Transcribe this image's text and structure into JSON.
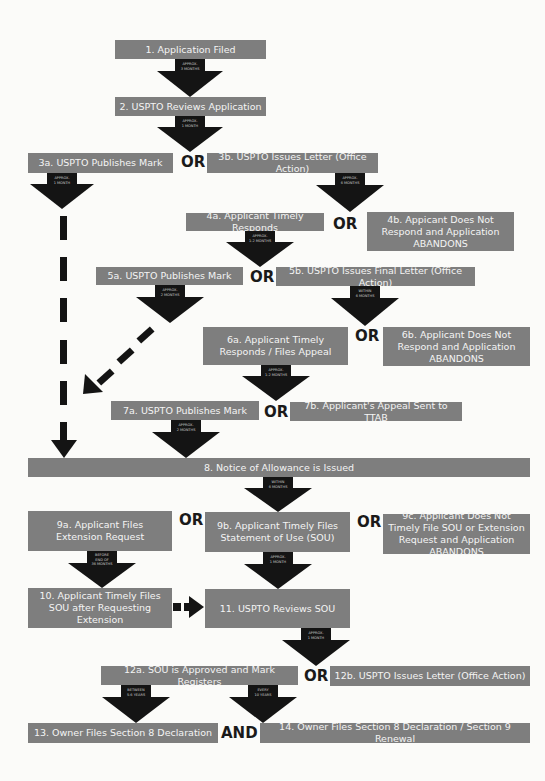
{
  "diagram": {
    "colors": {
      "box_fill": "#7e7e7e",
      "box_text": "#f4f4f4",
      "arrow": "#141414",
      "background": "#fbfbf9",
      "connector_text": "#1a1a1a"
    },
    "steps": {
      "s1": "1. Application Filed",
      "s2": "2. USPTO Reviews Application",
      "s3a": "3a. USPTO Publishes Mark",
      "s3b": "3b. USPTO Issues Letter (Office Action)",
      "s4a": "4a. Applicant Timely Responds",
      "s4b": "4b. Appicant Does Not Respond and Application ABANDONS",
      "s5a": "5a. USPTO Publishes Mark",
      "s5b": "5b. USPTO Issues Final Letter (Office Action)",
      "s6a": "6a. Applicant Timely Responds / Files Appeal",
      "s6b": "6b. Applicant Does Not Respond and Application ABANDONS",
      "s7a": "7a. USPTO Publishes Mark",
      "s7b": "7b. Applicant's Appeal Sent to TTAB",
      "s8": "8. Notice of Allowance is Issued",
      "s9a": "9a. Applicant Files Extension Request",
      "s9b": "9b. Applicant Timely Files Statement of Use (SOU)",
      "s9c": "9c. Applicant Does Not Timely File SOU or Extension Request and Application ABANDONS",
      "s10": "10. Applicant Timely Files SOU after Requesting Extension",
      "s11": "11. USPTO Reviews SOU",
      "s12a": "12a. SOU is Approved and Mark Registers",
      "s12b": "12b. USPTO Issues Letter (Office Action)",
      "s13": "13. Owner Files Section 8 Declaration",
      "s14": "14. Owner Files Section 8 Declaration / Section 9 Renewal"
    },
    "connectors": {
      "or": "OR",
      "and": "AND"
    },
    "arrow_labels": {
      "a1": "APPROX.\n3 MONTHS",
      "a2": "APPROX.\n1 MONTH",
      "a3a": "APPROX.\n1 MONTH",
      "a3b": "APPROX.\n6 MONTHS",
      "a4a": "APPROX.\n1-2 MONTHS",
      "a5a": "APPROX.\n2 MONTHS",
      "a5b": "WITHIN\n6 MONTHS",
      "a6a": "APPROX.\n1-2 MONTHS",
      "a7a": "APPROX.\n2 MONTHS",
      "a8": "WITHIN\n6 MONTHS",
      "a9a": "BEFORE\nEND OF\n36 MONTHS",
      "a9b": "APPROX.\n1 MONTH",
      "a11": "APPROX.\n1 MONTH",
      "a12a_left": "BETWEEN\n5-6 YEARS",
      "a12a_right": "EVERY\n10 YEARS"
    }
  }
}
